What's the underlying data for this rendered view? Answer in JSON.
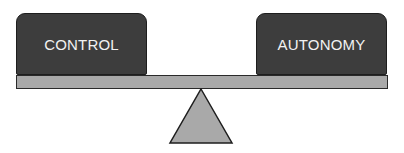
{
  "diagram": {
    "type": "balance-scale",
    "left_weight": {
      "label": "CONTROL"
    },
    "right_weight": {
      "label": "AUTONOMY"
    },
    "colors": {
      "weight_fill": "#3d3d3d",
      "weight_text": "#f2f2f2",
      "plank_fill": "#a9a9a9",
      "fulcrum_fill": "#a9a9a9",
      "outline": "#1e1e1e"
    }
  }
}
